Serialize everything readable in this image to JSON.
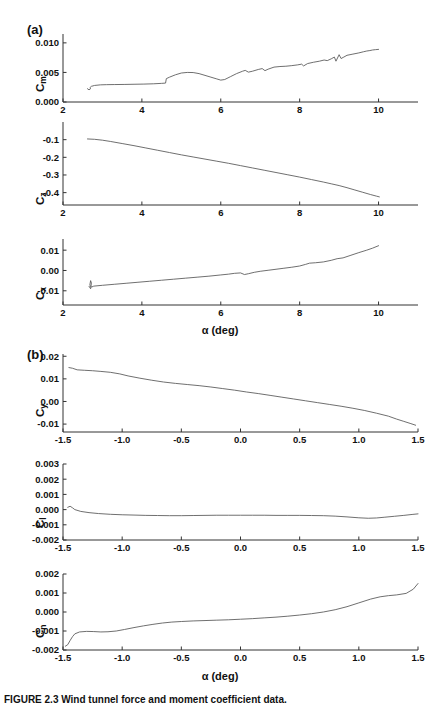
{
  "figure": {
    "caption": "FIGURE 2.3   Wind tunnel force and moment coefficient data.",
    "panel_a_letter": "(a)",
    "panel_b_letter": "(b)",
    "xlabel_a": "α (deg)",
    "xlabel_b": "α (deg)",
    "line_color": "#555555",
    "axis_color": "#333333"
  },
  "chart_data": [
    {
      "type": "line",
      "title": "(a) Cm vs alpha",
      "ylabel": "Cm",
      "xlabel": "α (deg)",
      "xlim": [
        2,
        11
      ],
      "ylim": [
        0.0,
        0.0115
      ],
      "xticks": [
        2,
        4,
        6,
        8,
        10
      ],
      "yticks": [
        0.0,
        0.005,
        0.01
      ],
      "xticklabels": [
        "2",
        "4",
        "6",
        "8",
        "10"
      ],
      "yticklabels": [
        "0.000",
        "0.005",
        "0.010"
      ],
      "grid": false,
      "legend": "none",
      "x": [
        2.62,
        2.66,
        2.7,
        2.68,
        2.72,
        2.8,
        2.95,
        3.1,
        3.3,
        3.55,
        3.8,
        4.05,
        4.3,
        4.5,
        4.6,
        4.62,
        4.7,
        4.85,
        5.0,
        5.15,
        5.3,
        5.45,
        5.6,
        5.75,
        5.9,
        6.0,
        6.1,
        6.25,
        6.4,
        6.55,
        6.62,
        6.7,
        6.8,
        6.95,
        7.05,
        7.12,
        7.2,
        7.35,
        7.5,
        7.65,
        7.8,
        7.95,
        8.05,
        8.1,
        8.2,
        8.35,
        8.5,
        8.62,
        8.7,
        8.8,
        8.88,
        8.92,
        9.0,
        9.05,
        9.12,
        9.2,
        9.35,
        9.5,
        9.62,
        9.7,
        9.78,
        9.85,
        9.92,
        10.0
      ],
      "y": [
        0.00225,
        0.00205,
        0.00225,
        0.0024,
        0.00265,
        0.0028,
        0.0029,
        0.00293,
        0.00295,
        0.00297,
        0.003,
        0.00303,
        0.00308,
        0.00315,
        0.0032,
        0.00395,
        0.0042,
        0.0046,
        0.0049,
        0.005,
        0.00498,
        0.0048,
        0.0045,
        0.0042,
        0.0039,
        0.0037,
        0.0038,
        0.0043,
        0.0048,
        0.0052,
        0.00535,
        0.00505,
        0.0052,
        0.0055,
        0.00565,
        0.0053,
        0.00555,
        0.0059,
        0.006,
        0.00605,
        0.00615,
        0.00628,
        0.0064,
        0.0061,
        0.0065,
        0.00672,
        0.0069,
        0.0071,
        0.007,
        0.0073,
        0.0076,
        0.0069,
        0.008,
        0.00735,
        0.0076,
        0.0079,
        0.0081,
        0.0083,
        0.0085,
        0.00862,
        0.0087,
        0.0088,
        0.00885,
        0.0089
      ]
    },
    {
      "type": "line",
      "title": "(a) Cz vs alpha",
      "ylabel": "Cz",
      "xlabel": "α (deg)",
      "xlim": [
        2,
        11
      ],
      "ylim": [
        -0.47,
        0.0
      ],
      "xticks": [
        2,
        4,
        6,
        8,
        10
      ],
      "yticks": [
        -0.1,
        -0.2,
        -0.3,
        -0.4
      ],
      "xticklabels": [
        "2",
        "4",
        "6",
        "8",
        "10"
      ],
      "yticklabels": [
        "-0.1",
        "-0.2",
        "-0.3",
        "-0.4"
      ],
      "grid": false,
      "legend": "none",
      "x": [
        2.62,
        2.8,
        3.0,
        3.2,
        3.5,
        3.8,
        4.1,
        4.4,
        4.7,
        5.0,
        5.3,
        5.6,
        5.9,
        6.2,
        6.5,
        6.8,
        7.1,
        7.4,
        7.7,
        8.0,
        8.3,
        8.6,
        8.8,
        9.0,
        9.2,
        9.4,
        9.6,
        9.8,
        9.95,
        10.02
      ],
      "y": [
        -0.096,
        -0.098,
        -0.103,
        -0.11,
        -0.122,
        -0.134,
        -0.147,
        -0.16,
        -0.173,
        -0.186,
        -0.198,
        -0.21,
        -0.222,
        -0.234,
        -0.247,
        -0.26,
        -0.273,
        -0.286,
        -0.299,
        -0.312,
        -0.326,
        -0.34,
        -0.35,
        -0.36,
        -0.372,
        -0.385,
        -0.398,
        -0.411,
        -0.42,
        -0.424
      ]
    },
    {
      "type": "line",
      "title": "(a) Cx vs alpha",
      "ylabel": "Cx",
      "xlabel": "α (deg)",
      "xlim": [
        2,
        11
      ],
      "ylim": [
        -0.017,
        0.0155
      ],
      "xticks": [
        2,
        4,
        6,
        8,
        10
      ],
      "yticks": [
        -0.01,
        0.0,
        0.01
      ],
      "xticklabels": [
        "2",
        "4",
        "6",
        "8",
        "10"
      ],
      "yticklabels": [
        "-0.01",
        "0.00",
        "0.01"
      ],
      "grid": false,
      "legend": "none",
      "x": [
        2.66,
        2.7,
        2.72,
        2.7,
        2.68,
        2.72,
        2.78,
        3.0,
        3.3,
        3.6,
        3.9,
        4.2,
        4.5,
        4.8,
        5.1,
        5.4,
        5.7,
        6.0,
        6.2,
        6.35,
        6.5,
        6.6,
        6.7,
        6.85,
        7.0,
        7.2,
        7.4,
        7.6,
        7.8,
        8.0,
        8.15,
        8.25,
        8.4,
        8.6,
        8.8,
        8.95,
        9.1,
        9.3,
        9.5,
        9.7,
        9.85,
        10.0
      ],
      "y": [
        -0.0078,
        -0.009,
        -0.0062,
        -0.005,
        -0.0072,
        -0.0082,
        -0.0077,
        -0.0073,
        -0.0068,
        -0.0063,
        -0.0058,
        -0.0053,
        -0.0048,
        -0.0043,
        -0.0038,
        -0.0033,
        -0.0028,
        -0.0022,
        -0.0018,
        -0.0014,
        -0.0012,
        -0.002,
        -0.0016,
        -0.0009,
        -0.0004,
        0.0001,
        0.0006,
        0.0011,
        0.0016,
        0.0022,
        0.003,
        0.0036,
        0.0038,
        0.0042,
        0.005,
        0.0058,
        0.0062,
        0.0075,
        0.0088,
        0.01,
        0.011,
        0.0122
      ]
    },
    {
      "type": "line",
      "title": "(b) Cy vs alpha",
      "ylabel": "Cy",
      "xlabel": "α (deg)",
      "xlim": [
        -1.5,
        1.5
      ],
      "ylim": [
        -0.0135,
        0.021
      ],
      "xticks": [
        -1.5,
        -1.0,
        -0.5,
        0.0,
        0.5,
        1.0,
        1.5
      ],
      "yticks": [
        -0.01,
        0.0,
        0.01,
        0.02
      ],
      "xticklabels": [
        "-1.5",
        "-1.0",
        "-0.5",
        "0.0",
        "0.5",
        "1.0",
        "1.5"
      ],
      "yticklabels": [
        "-0.01",
        "0.00",
        "0.01",
        "0.02"
      ],
      "grid": false,
      "legend": "none",
      "x": [
        -1.45,
        -1.42,
        -1.38,
        -1.32,
        -1.25,
        -1.18,
        -1.1,
        -1.02,
        -0.95,
        -0.85,
        -0.75,
        -0.65,
        -0.55,
        -0.45,
        -0.35,
        -0.25,
        -0.15,
        -0.05,
        0.05,
        0.15,
        0.25,
        0.35,
        0.45,
        0.55,
        0.65,
        0.75,
        0.85,
        0.95,
        1.05,
        1.15,
        1.25,
        1.32,
        1.38,
        1.44,
        1.48
      ],
      "y": [
        0.015,
        0.0147,
        0.014,
        0.0138,
        0.0136,
        0.0133,
        0.0129,
        0.0122,
        0.0113,
        0.0103,
        0.0094,
        0.0086,
        0.008,
        0.0075,
        0.007,
        0.0064,
        0.0057,
        0.005,
        0.0042,
        0.0035,
        0.0027,
        0.0019,
        0.0011,
        0.0003,
        -0.0005,
        -0.0013,
        -0.0021,
        -0.003,
        -0.004,
        -0.0052,
        -0.0065,
        -0.0078,
        -0.0088,
        -0.0098,
        -0.0105
      ]
    },
    {
      "type": "line",
      "title": "(b) Cl vs alpha",
      "ylabel": "Cl",
      "xlabel": "α (deg)",
      "xlim": [
        -1.5,
        1.5
      ],
      "ylim": [
        -0.002,
        0.003
      ],
      "xticks": [
        -1.5,
        -1.0,
        -0.5,
        0.0,
        0.5,
        1.0,
        1.5
      ],
      "yticks": [
        -0.002,
        -0.001,
        0.0,
        0.001,
        0.002,
        0.003
      ],
      "xticklabels": [
        "-1.5",
        "-1.0",
        "-0.5",
        "0.0",
        "0.5",
        "1.0",
        "1.5"
      ],
      "yticklabels": [
        "-0.002",
        "-0.001",
        "0.000",
        "0.001",
        "0.002",
        "0.003"
      ],
      "grid": false,
      "legend": "none",
      "x": [
        -1.46,
        -1.44,
        -1.42,
        -1.4,
        -1.35,
        -1.28,
        -1.2,
        -1.1,
        -1.0,
        -0.9,
        -0.8,
        -0.7,
        -0.6,
        -0.5,
        -0.4,
        -0.3,
        -0.2,
        -0.1,
        0.0,
        0.1,
        0.2,
        0.3,
        0.4,
        0.5,
        0.6,
        0.7,
        0.8,
        0.9,
        1.0,
        1.08,
        1.15,
        1.22,
        1.3,
        1.38,
        1.45,
        1.5
      ],
      "y": [
        0.00015,
        0.00022,
        0.00012,
        0.0,
        -0.00012,
        -0.0002,
        -0.00026,
        -0.00031,
        -0.00034,
        -0.00036,
        -0.00038,
        -0.00039,
        -0.0004,
        -0.0004,
        -0.00039,
        -0.00038,
        -0.00037,
        -0.00037,
        -0.00037,
        -0.00037,
        -0.00037,
        -0.00038,
        -0.00038,
        -0.00038,
        -0.00039,
        -0.0004,
        -0.00043,
        -0.00048,
        -0.00054,
        -0.00057,
        -0.00055,
        -0.0005,
        -0.00044,
        -0.00038,
        -0.00032,
        -0.00028
      ]
    },
    {
      "type": "line",
      "title": "(b) Cn vs alpha",
      "ylabel": "Cn",
      "xlabel": "α (deg)",
      "xlim": [
        -1.5,
        1.5
      ],
      "ylim": [
        -0.002,
        0.002
      ],
      "xticks": [
        -1.5,
        -1.0,
        -0.5,
        0.0,
        0.5,
        1.0,
        1.5
      ],
      "yticks": [
        -0.002,
        -0.001,
        0.0,
        0.001,
        0.002
      ],
      "xticklabels": [
        "-1.5",
        "-1.0",
        "-0.5",
        "0.0",
        "0.5",
        "1.0",
        "1.5"
      ],
      "yticklabels": [
        "-0.002",
        "-0.001",
        "0.000",
        "0.001",
        "0.002"
      ],
      "grid": false,
      "legend": "none",
      "x": [
        -1.48,
        -1.46,
        -1.44,
        -1.42,
        -1.4,
        -1.36,
        -1.3,
        -1.24,
        -1.18,
        -1.12,
        -1.05,
        -0.98,
        -0.9,
        -0.82,
        -0.74,
        -0.66,
        -0.58,
        -0.5,
        -0.4,
        -0.3,
        -0.2,
        -0.1,
        0.0,
        0.1,
        0.2,
        0.3,
        0.4,
        0.5,
        0.6,
        0.7,
        0.8,
        0.9,
        1.0,
        1.1,
        1.18,
        1.25,
        1.32,
        1.4,
        1.46,
        1.5
      ],
      "y": [
        -0.0018,
        -0.00172,
        -0.0015,
        -0.0013,
        -0.00115,
        -0.00105,
        -0.00102,
        -0.00103,
        -0.00105,
        -0.00104,
        -0.001,
        -0.00092,
        -0.00082,
        -0.00073,
        -0.00065,
        -0.00058,
        -0.00053,
        -0.0005,
        -0.00047,
        -0.00045,
        -0.00043,
        -0.00041,
        -0.00038,
        -0.00035,
        -0.00031,
        -0.00027,
        -0.00022,
        -0.00016,
        -9e-05,
        0.0,
        0.00012,
        0.00028,
        0.00048,
        0.00068,
        0.0008,
        0.00086,
        0.0009,
        0.00098,
        0.0012,
        0.0015
      ]
    }
  ]
}
